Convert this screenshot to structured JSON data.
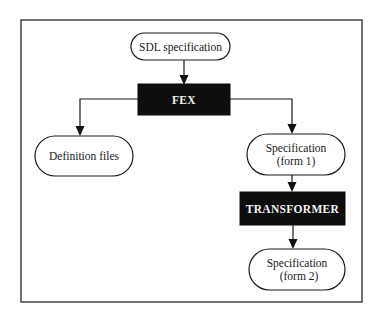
{
  "diagram": {
    "type": "flowchart",
    "nodes": {
      "sdl_spec": {
        "shape": "terminal",
        "lines": [
          "SDL specification"
        ]
      },
      "fex": {
        "shape": "process",
        "lines": [
          "FEX"
        ]
      },
      "definition_files": {
        "shape": "terminal",
        "lines": [
          "Definition files"
        ]
      },
      "spec_form1": {
        "shape": "terminal",
        "lines": [
          "Specification",
          "(form 1)"
        ]
      },
      "transformer": {
        "shape": "process",
        "lines": [
          "TRANSFORMER"
        ]
      },
      "spec_form2": {
        "shape": "terminal",
        "lines": [
          "Specification",
          "(form 2)"
        ]
      }
    },
    "edges": [
      {
        "from": "sdl_spec",
        "to": "fex"
      },
      {
        "from": "fex",
        "to": "definition_files"
      },
      {
        "from": "fex",
        "to": "spec_form1"
      },
      {
        "from": "spec_form1",
        "to": "transformer"
      },
      {
        "from": "transformer",
        "to": "spec_form2"
      }
    ]
  }
}
